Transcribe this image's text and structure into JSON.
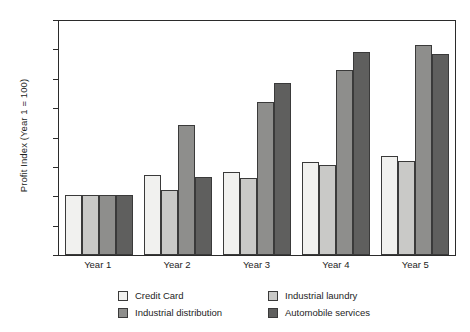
{
  "chart_data": {
    "type": "bar",
    "title": "",
    "subtitle": "",
    "xlabel": "",
    "ylabel": "Profit Index (Year 1 = 100)",
    "categories": [
      "Year 1",
      "Year 2",
      "Year 3",
      "Year 4",
      "Year 5"
    ],
    "series": [
      {
        "name": "Credit Card",
        "color": "#f1f1ef",
        "values": [
          103,
          136,
          141,
          159,
          168
        ]
      },
      {
        "name": "Industrial laundry",
        "color": "#c9c9c7",
        "values": [
          103,
          110,
          131,
          153,
          160
        ]
      },
      {
        "name": "Industrial distribution",
        "color": "#8e8e8c",
        "values": [
          103,
          222,
          261,
          315,
          357
        ]
      },
      {
        "name": "Automobile services",
        "color": "#5f5f5e",
        "values": [
          103,
          132,
          292,
          345,
          343
        ]
      }
    ],
    "ylim": [
      0,
      400
    ],
    "ytick_step": 50,
    "yticks": [
      "0",
      "50",
      "100",
      "150",
      "200",
      "250",
      "300",
      "350",
      "400"
    ],
    "grid": false,
    "legend_position": "bottom",
    "legend_columns": 2
  },
  "legend": {
    "items": [
      {
        "label": "Credit Card"
      },
      {
        "label": "Industrial laundry"
      },
      {
        "label": "Industrial distribution"
      },
      {
        "label": "Automobile services"
      }
    ]
  }
}
